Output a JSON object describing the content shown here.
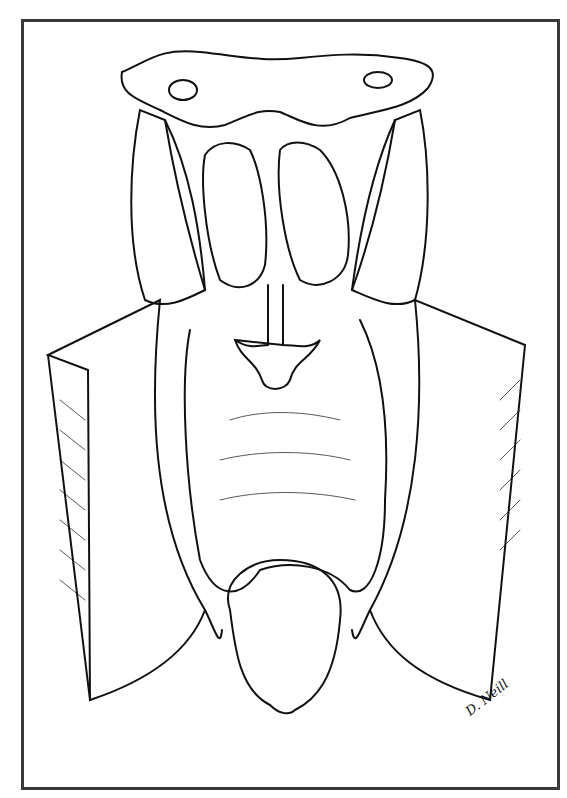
{
  "figure": {
    "type": "anatomical line illustration",
    "signature": "D. Neill",
    "colors": {
      "ink": "#111111",
      "frame": "#3a3a3a",
      "background": "#ffffff"
    }
  }
}
